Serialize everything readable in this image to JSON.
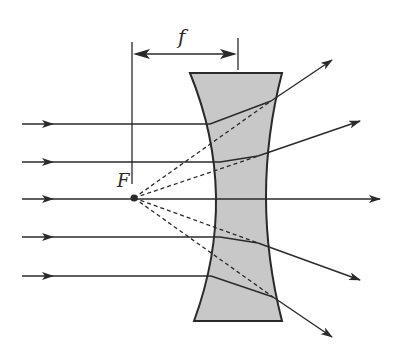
{
  "diagram": {
    "labels": {
      "focal_length": "f",
      "focal_point": "F"
    },
    "colors": {
      "lens_fill": "#c8c8c8",
      "stroke": "#2a2a2a",
      "background": "#ffffff"
    },
    "incident_rays_y": [
      124,
      162,
      199,
      237,
      276
    ]
  }
}
